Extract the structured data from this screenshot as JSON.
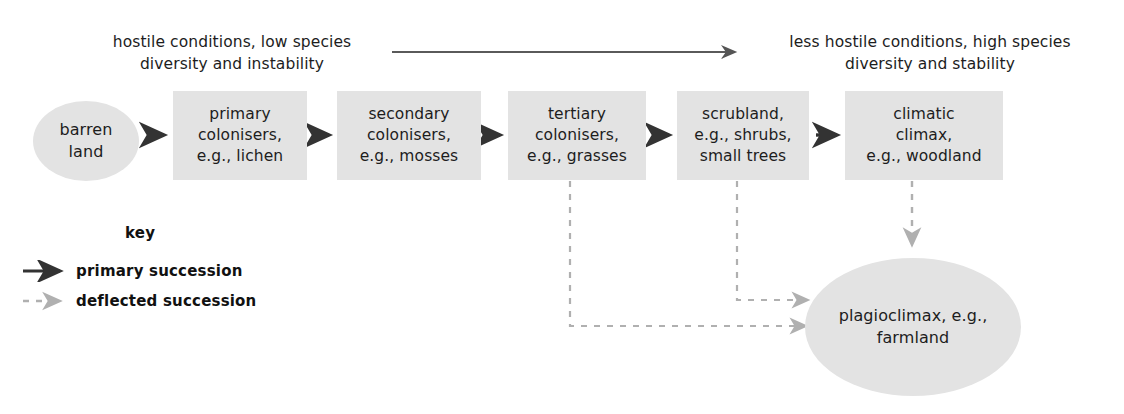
{
  "diagram": {
    "captions": {
      "left": "hostile conditions, low species\ndiversity and instability",
      "left_line1": "hostile conditions, low species",
      "left_line2": "diversity and instability",
      "right_line1": "less hostile conditions, high species",
      "right_line2": "diversity and stability"
    },
    "gradient_arrow": {
      "name": "conditions-gradient-arrow",
      "from_x": 392,
      "to_x": 743,
      "y": 52,
      "style": "solid"
    },
    "stages": [
      {
        "id": "barren",
        "shape": "ellipse",
        "lines": [
          "barren",
          "land"
        ]
      },
      {
        "id": "primary",
        "shape": "box",
        "lines": [
          "primary",
          "colonisers,",
          "e.g., lichen"
        ]
      },
      {
        "id": "secondary",
        "shape": "box",
        "lines": [
          "secondary",
          "colonisers,",
          "e.g., mosses"
        ]
      },
      {
        "id": "tertiary",
        "shape": "box",
        "lines": [
          "tertiary",
          "colonisers,",
          "e.g., grasses"
        ]
      },
      {
        "id": "scrubland",
        "shape": "box",
        "lines": [
          "scrubland,",
          "e.g., shrubs,",
          "small trees"
        ]
      },
      {
        "id": "climax",
        "shape": "box",
        "lines": [
          "climatic",
          "climax,",
          "e.g., woodland"
        ]
      }
    ],
    "endpoint": {
      "id": "plagioclimax",
      "shape": "ellipse",
      "lines": [
        "plagioclimax, e.g.,",
        "farmland"
      ]
    },
    "key": {
      "title": "key",
      "entries": [
        {
          "id": "primary-succession",
          "label": "primary succession",
          "style": "solid"
        },
        {
          "id": "deflected-succession",
          "label": "deflected succession",
          "style": "dashed"
        }
      ]
    },
    "deflected_sources": [
      "tertiary",
      "scrubland",
      "climax"
    ],
    "colors": {
      "node_fill": "#e3e3e3",
      "text": "#1d1d1d",
      "solid_arrow": "#333333",
      "dashed_arrow": "#a9a9a9",
      "background": "#ffffff"
    }
  }
}
